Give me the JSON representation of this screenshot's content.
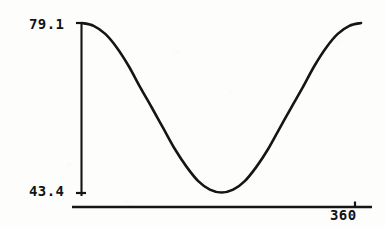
{
  "chart_data": {
    "type": "line",
    "title": "",
    "subtitle": "",
    "xlabel": "",
    "ylabel": "",
    "grid": false,
    "legend": null,
    "xlim": [
      0,
      360
    ],
    "ylim": [
      43.4,
      79.1
    ],
    "x_tick_labels": [
      "360"
    ],
    "y_tick_labels": [
      "79.1",
      "43.4"
    ],
    "y_max_label": "79.1",
    "y_min_label": "43.4",
    "x_max_label": "360",
    "series": [
      {
        "name": "curve",
        "description": "raised cosine, maximum at x=0 and x=360, minimum at x=180",
        "x": [
          0,
          15,
          30,
          45,
          60,
          75,
          90,
          105,
          120,
          135,
          150,
          165,
          180,
          195,
          210,
          225,
          240,
          255,
          270,
          285,
          300,
          315,
          330,
          345,
          360
        ],
        "values": [
          79.1,
          78.5,
          76.8,
          73.9,
          70.1,
          65.6,
          61.3,
          56.9,
          52.5,
          48.8,
          45.8,
          44.0,
          43.4,
          44.0,
          45.8,
          48.8,
          52.5,
          56.9,
          61.3,
          65.6,
          70.1,
          73.9,
          76.8,
          78.5,
          79.1
        ]
      }
    ]
  },
  "axes": {
    "y_axis_name": "vertical-axis-line",
    "x_axis_name": "horizontal-axis-line"
  },
  "colors": {
    "ink": "#151515",
    "paper": "#fdfdfc"
  }
}
